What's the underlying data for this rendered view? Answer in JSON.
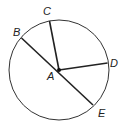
{
  "diagram": {
    "type": "circle-geometry",
    "circle": {
      "cx": 59,
      "cy": 70,
      "r": 50,
      "stroke": "#333333"
    },
    "center": {
      "label": "A",
      "x": 59,
      "y": 70,
      "label_x": 48,
      "label_y": 80
    },
    "points": [
      {
        "label": "B",
        "x": 21.5,
        "y": 38,
        "label_x": 13,
        "label_y": 36
      },
      {
        "label": "C",
        "x": 49.5,
        "y": 21,
        "label_x": 44,
        "label_y": 15
      },
      {
        "label": "D",
        "x": 107.5,
        "y": 63,
        "label_x": 110,
        "label_y": 67
      },
      {
        "label": "E",
        "x": 93,
        "y": 105,
        "label_x": 98,
        "label_y": 117
      }
    ],
    "segments": [
      {
        "name": "diameter-BE",
        "from": "B",
        "to": "E",
        "through": "A"
      },
      {
        "name": "radius-AC",
        "from": "A",
        "to": "C"
      },
      {
        "name": "radius-AD",
        "from": "A",
        "to": "D"
      }
    ],
    "labels": {
      "A": "A",
      "B": "B",
      "C": "C",
      "D": "D",
      "E": "E"
    }
  }
}
